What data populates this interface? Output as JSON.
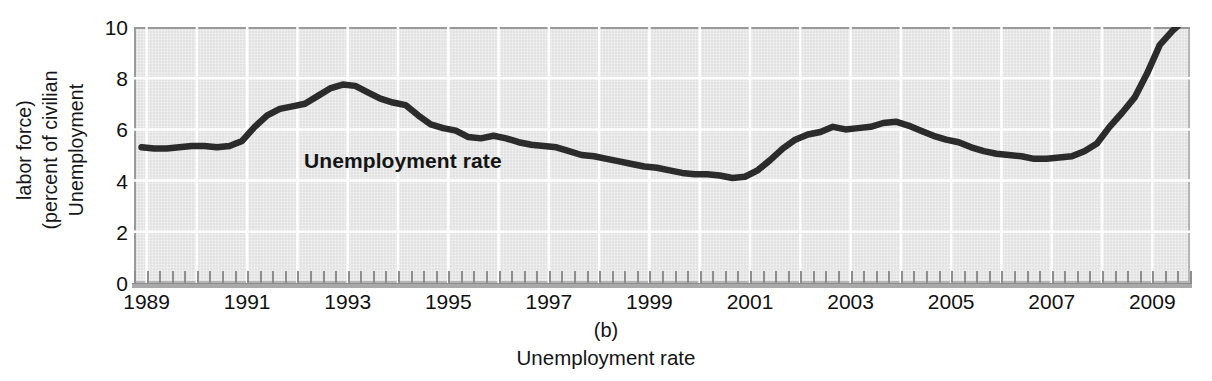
{
  "figure": {
    "caption_letter": "(b)",
    "caption_text": "Unemployment rate",
    "series_label": "Unemployment rate",
    "ylabel_lines": [
      "Unemployment",
      "(percent of civilian",
      "labor force)"
    ]
  },
  "colors": {
    "plot_background": "#e2e2e2",
    "gridline": "#ffffff",
    "series_line": "#2b2b2b",
    "frame": "#9a9a9a",
    "text": "#111111"
  },
  "chart_data": {
    "type": "line",
    "title": "Unemployment rate",
    "subtitle": "(b)",
    "xlabel": "",
    "ylabel": "Unemployment (percent of civilian labor force)",
    "xlim": [
      1988.75,
      2009.75
    ],
    "ylim": [
      0,
      10
    ],
    "yticks": [
      0,
      2,
      4,
      6,
      8,
      10
    ],
    "ytick_labels": [
      "0",
      "2",
      "4",
      "6",
      "8",
      "10"
    ],
    "xticks": [
      1989,
      1991,
      1993,
      1995,
      1997,
      1999,
      2001,
      2003,
      2005,
      2007,
      2009
    ],
    "xtick_labels": [
      "1989",
      "1991",
      "1993",
      "1995",
      "1997",
      "1999",
      "2001",
      "2003",
      "2005",
      "2007",
      "2009"
    ],
    "x_minor_tick_interval": 0.25,
    "grid": true,
    "grid_axis": "both",
    "legend": "inline-annotation",
    "annotations": [
      {
        "text": "Unemployment rate",
        "x": 1992.9,
        "y": 4.9,
        "bold": true
      }
    ],
    "series": [
      {
        "name": "Unemployment rate",
        "units": "percent of civilian labor force",
        "x": [
          1988.9,
          1989.15,
          1989.4,
          1989.65,
          1989.9,
          1990.15,
          1990.4,
          1990.65,
          1990.9,
          1991.15,
          1991.4,
          1991.65,
          1991.9,
          1992.15,
          1992.4,
          1992.65,
          1992.9,
          1993.15,
          1993.4,
          1993.65,
          1993.9,
          1994.15,
          1994.4,
          1994.65,
          1994.9,
          1995.15,
          1995.4,
          1995.65,
          1995.9,
          1996.15,
          1996.4,
          1996.65,
          1996.9,
          1997.15,
          1997.4,
          1997.65,
          1997.9,
          1998.15,
          1998.4,
          1998.65,
          1998.9,
          1999.15,
          1999.4,
          1999.65,
          1999.9,
          2000.15,
          2000.4,
          2000.65,
          2000.9,
          2001.15,
          2001.4,
          2001.65,
          2001.9,
          2002.15,
          2002.4,
          2002.65,
          2002.9,
          2003.15,
          2003.4,
          2003.65,
          2003.9,
          2004.15,
          2004.4,
          2004.65,
          2004.9,
          2005.15,
          2005.4,
          2005.65,
          2005.9,
          2006.15,
          2006.4,
          2006.65,
          2006.9,
          2007.15,
          2007.4,
          2007.65,
          2007.9,
          2008.15,
          2008.4,
          2008.65,
          2008.9,
          2009.15,
          2009.4,
          2009.65
        ],
        "y": [
          5.3,
          5.25,
          5.25,
          5.3,
          5.35,
          5.35,
          5.3,
          5.35,
          5.55,
          6.1,
          6.55,
          6.8,
          6.9,
          7.0,
          7.3,
          7.6,
          7.75,
          7.7,
          7.45,
          7.2,
          7.05,
          6.95,
          6.55,
          6.2,
          6.05,
          5.95,
          5.7,
          5.65,
          5.75,
          5.65,
          5.5,
          5.4,
          5.35,
          5.3,
          5.15,
          5.0,
          4.95,
          4.85,
          4.75,
          4.65,
          4.55,
          4.5,
          4.4,
          4.3,
          4.25,
          4.25,
          4.2,
          4.1,
          4.15,
          4.4,
          4.8,
          5.25,
          5.6,
          5.8,
          5.9,
          6.1,
          6.0,
          6.05,
          6.1,
          6.25,
          6.3,
          6.15,
          5.95,
          5.75,
          5.6,
          5.5,
          5.3,
          5.15,
          5.05,
          5.0,
          4.95,
          4.85,
          4.85,
          4.9,
          4.95,
          5.15,
          5.45,
          6.1,
          6.65,
          7.25,
          8.2,
          9.3,
          9.85,
          10.3
        ]
      }
    ]
  }
}
